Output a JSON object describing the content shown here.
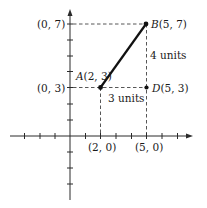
{
  "figure": {
    "type": "coordinate-plane-distance-diagram",
    "axis_color": "#2a2a2a",
    "segment_color": "#111111",
    "points": {
      "A": {
        "name": "A",
        "coords": "(2, 3)",
        "x": 2,
        "y": 3
      },
      "B": {
        "name": "B",
        "coords": "(5, 7)",
        "x": 5,
        "y": 7
      },
      "D": {
        "name": "D",
        "coords": "(5, 3)",
        "x": 5,
        "y": 3
      }
    },
    "axis_labels": {
      "y7": "(0, 7)",
      "y3": "(0, 3)",
      "x2": "(2, 0)",
      "x5": "(5, 0)"
    },
    "measurements": {
      "horizontal": "3 units",
      "vertical": "4 units"
    },
    "x_ticks": [
      -4,
      -3,
      -2,
      1,
      2,
      3,
      4,
      5,
      6,
      7
    ],
    "y_ticks": [
      -4,
      -3,
      -2,
      -1,
      1,
      2,
      3,
      4,
      5,
      6,
      7
    ]
  }
}
